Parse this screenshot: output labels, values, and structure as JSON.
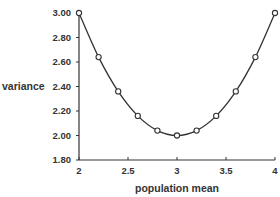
{
  "chart_data": {
    "type": "line",
    "title": "",
    "xlabel": "population mean",
    "ylabel": "variance",
    "x": [
      2.0,
      2.2,
      2.4,
      2.6,
      2.8,
      3.0,
      3.2,
      3.4,
      3.6,
      3.8,
      4.0
    ],
    "series": [
      {
        "name": "variance",
        "values": [
          3.0,
          2.64,
          2.36,
          2.16,
          2.04,
          2.0,
          2.04,
          2.16,
          2.36,
          2.64,
          3.0
        ],
        "marker": "open-circle",
        "line": "smooth"
      }
    ],
    "xlim": [
      2,
      4
    ],
    "ylim": [
      1.8,
      3.0
    ],
    "xticks": [
      "2",
      "2.5",
      "3",
      "3.5",
      "4"
    ],
    "yticks": [
      "1.80",
      "2.00",
      "2.20",
      "2.40",
      "2.60",
      "2.80",
      "3.00"
    ],
    "grid": false,
    "legend": "none",
    "colors": {
      "line": "#333333",
      "marker_fill": "#ffffff",
      "axis": "#333333"
    }
  }
}
